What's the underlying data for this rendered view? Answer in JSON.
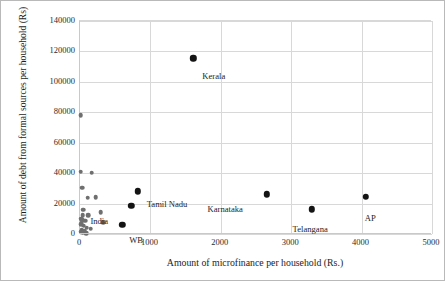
{
  "chart_data": {
    "type": "scatter",
    "title": "",
    "xlabel": "Amount of microfinance per household (Rs.)",
    "ylabel": "Amount of debt from formal sources per household (Rs)",
    "xlim": [
      0,
      5000
    ],
    "ylim": [
      0,
      140000
    ],
    "xticks": [
      0,
      1000,
      2000,
      3000,
      4000,
      5000
    ],
    "yticks": [
      0,
      20000,
      40000,
      60000,
      80000,
      100000,
      120000,
      140000
    ],
    "xtick_labels": [
      "0",
      "1000",
      "2000",
      "3000",
      "4000",
      "5000"
    ],
    "ytick_labels": [
      "0",
      "20000",
      "40000",
      "60000",
      "80000",
      "100000",
      "120000",
      "140000"
    ],
    "grid": true,
    "legend": "none",
    "series": [
      {
        "name": "Labelled states",
        "marker": "filled-circle-large",
        "color": "#141414",
        "points": [
          {
            "label": "Kerala",
            "x": 1610,
            "y": 115500,
            "label_dx": 10,
            "label_dy": 14
          },
          {
            "label": "Tamil Nadu",
            "x": 820,
            "y": 28000,
            "label_dx": 10,
            "label_dy": 9
          },
          {
            "label": "India",
            "x": 730,
            "y": 18500,
            "label_dx": -40,
            "label_dy": 11
          },
          {
            "label": "WB",
            "x": 600,
            "y": 6000,
            "label_dx": 8,
            "label_dy": 11
          },
          {
            "label": "Karnataka",
            "x": 2650,
            "y": 26000,
            "label_dx": -58,
            "label_dy": 11
          },
          {
            "label": "Telangana",
            "x": 3290,
            "y": 16200,
            "label_dx": -18,
            "label_dy": 16
          },
          {
            "label": "AP",
            "x": 4060,
            "y": 24500,
            "label_dx": 0,
            "label_dy": 17
          }
        ]
      },
      {
        "name": "Other states",
        "marker": "filled-circle-small",
        "color": "#6f6f6f",
        "points": [
          {
            "x": 10,
            "y": 78000
          },
          {
            "x": 8,
            "y": 41000
          },
          {
            "x": 165,
            "y": 40200
          },
          {
            "x": 30,
            "y": 30500
          },
          {
            "x": 110,
            "y": 23800
          },
          {
            "x": 225,
            "y": 24300
          },
          {
            "x": 45,
            "y": 16000
          },
          {
            "x": 295,
            "y": 14200
          },
          {
            "x": 40,
            "y": 12300
          },
          {
            "x": 120,
            "y": 12200
          },
          {
            "x": 20,
            "y": 10000
          },
          {
            "x": 35,
            "y": 9000
          },
          {
            "x": 75,
            "y": 8700
          },
          {
            "x": 330,
            "y": 7600
          },
          {
            "x": 18,
            "y": 6300
          },
          {
            "x": 55,
            "y": 5400
          },
          {
            "x": 95,
            "y": 4200
          },
          {
            "x": 150,
            "y": 3400
          },
          {
            "x": 25,
            "y": 2600
          },
          {
            "x": 60,
            "y": 2300
          },
          {
            "x": 12,
            "y": 1400
          },
          {
            "x": 40,
            "y": 900
          },
          {
            "x": 90,
            "y": 600
          }
        ]
      }
    ]
  }
}
